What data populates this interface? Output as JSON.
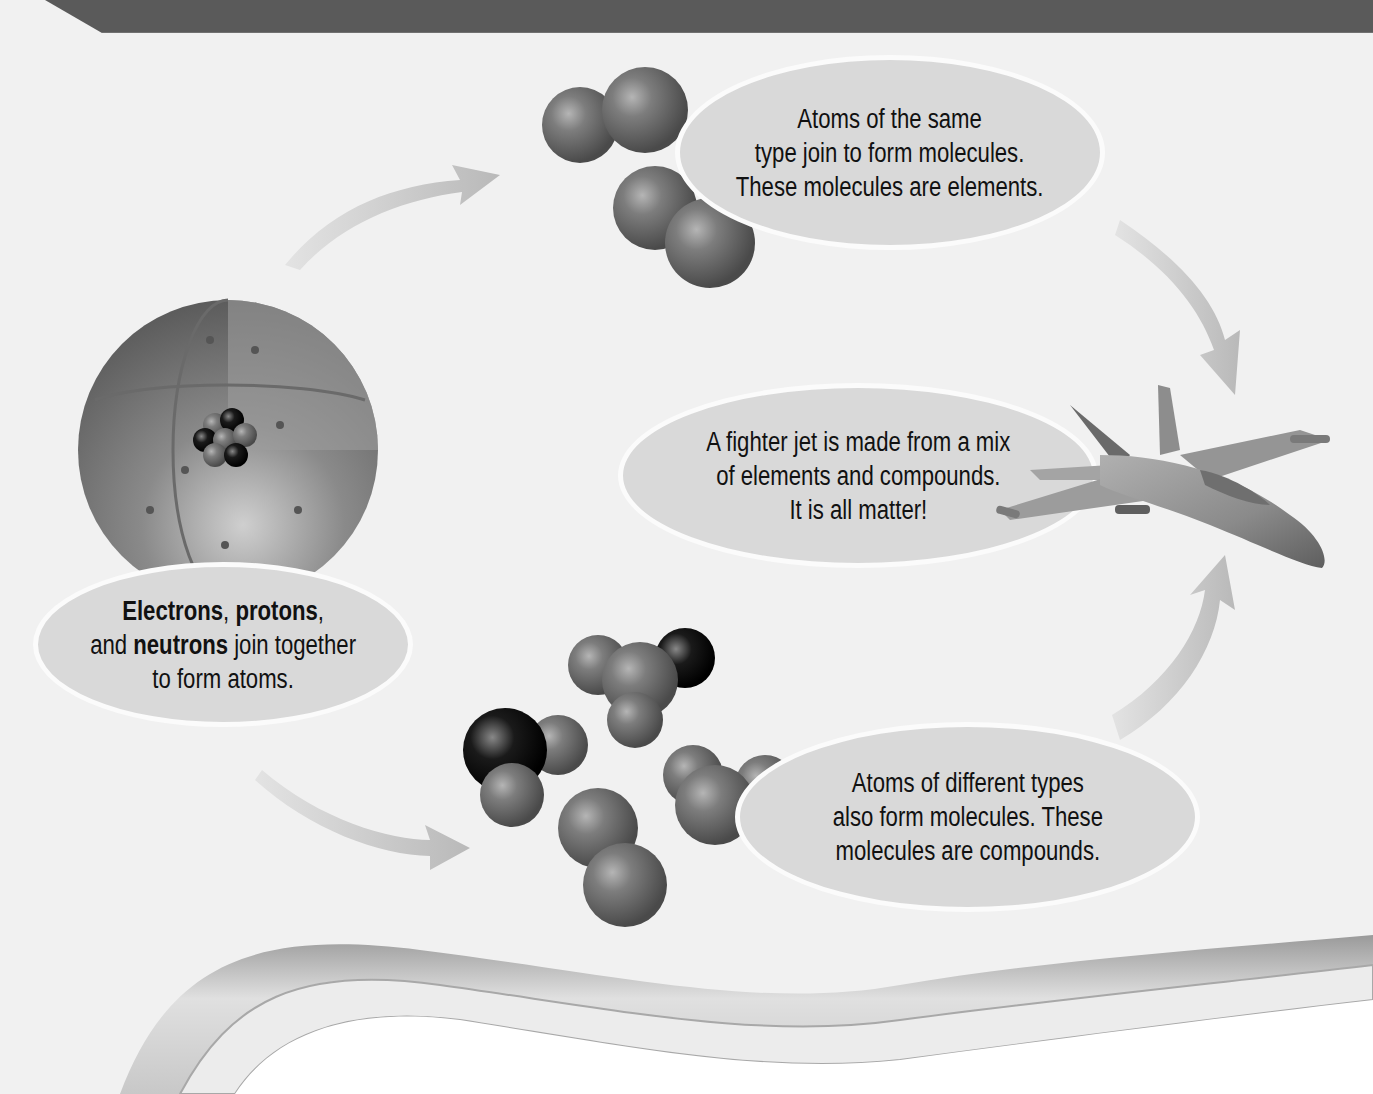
{
  "diagram": {
    "header_bar_color": "#5a5a5a",
    "background_color": "#f1f1f1",
    "bubble_color": "#d9d9d9",
    "nodes": [
      {
        "id": "atom",
        "image": "atom-cutaway-icon",
        "caption": {
          "part1_bold": "Electrons",
          "part2": ", ",
          "part3_bold": "protons",
          "part4": ",",
          "part5": "and ",
          "part6_bold": "neutrons",
          "part7": " join together",
          "part8": "to form atoms."
        }
      },
      {
        "id": "elements",
        "image": "diatomic-molecules-icon",
        "caption": {
          "line1": "Atoms of the same",
          "line2": "type join to form molecules.",
          "line3": "These molecules are elements."
        }
      },
      {
        "id": "compounds",
        "image": "compound-molecules-icon",
        "caption": {
          "line1": "Atoms of different types",
          "line2": "also form molecules. These",
          "line3": "molecules are compounds."
        }
      },
      {
        "id": "matter",
        "image": "fighter-jet-icon",
        "caption": {
          "line1": "A fighter jet is made from a mix",
          "line2": "of elements and compounds.",
          "line3": "It is all matter!"
        }
      }
    ],
    "arrows": [
      {
        "from": "atom",
        "to": "elements"
      },
      {
        "from": "atom",
        "to": "compounds"
      },
      {
        "from": "elements",
        "to": "matter"
      },
      {
        "from": "compounds",
        "to": "matter"
      }
    ]
  }
}
